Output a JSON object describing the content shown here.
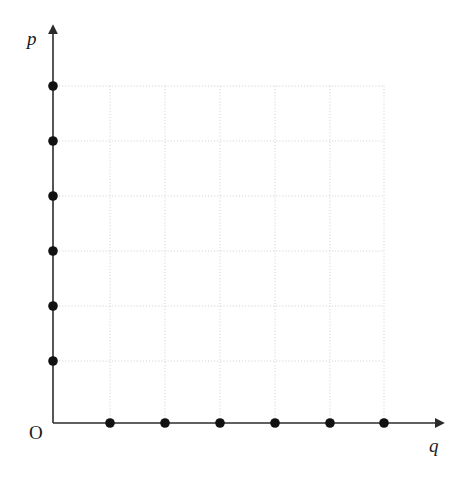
{
  "figure": {
    "kind": "coordinate-grid-scatter",
    "background_color": "#ffffff",
    "width": 463,
    "height": 482
  },
  "labels": {
    "y_axis": "p",
    "x_axis": "q",
    "origin": "O"
  },
  "axes": {
    "origin_px": {
      "x": 53,
      "y": 423
    },
    "x_axis_end_px": {
      "x": 437,
      "y": 423
    },
    "y_axis_end_px": {
      "x": 53,
      "y": 32
    },
    "axis_color": "#2b2b2b",
    "axis_width_px": 1.6,
    "arrow_heads": [
      "x-axis-right",
      "y-axis-up"
    ]
  },
  "grid": {
    "style": "dotted",
    "color": "#c9c9c9",
    "line_width_px": 0.9,
    "x_positions_px": [
      110,
      165,
      220,
      275,
      330,
      384
    ],
    "y_positions_px": [
      86,
      141,
      196,
      251,
      306,
      361
    ],
    "left_px": 53,
    "right_px": 384,
    "top_px": 86,
    "bottom_px": 423
  },
  "chart_data": {
    "type": "scatter",
    "title": "",
    "subtitle": "",
    "xlabel": "q",
    "ylabel": "p",
    "grid": true,
    "legend": "none",
    "xlim": [
      0,
      7
    ],
    "ylim": [
      0,
      7
    ],
    "x_tick_values": [
      1,
      2,
      3,
      4,
      5,
      6
    ],
    "y_tick_values": [
      1,
      2,
      3,
      4,
      5,
      6
    ],
    "x_tick_labels": [
      "",
      "",
      "",
      "",
      "",
      ""
    ],
    "y_tick_labels": [
      "",
      "",
      "",
      "",
      "",
      ""
    ],
    "marker": "filled-circle",
    "marker_color": "#111111",
    "marker_radius_px": 4.8,
    "series": [
      {
        "name": "points-on-q-axis",
        "points": [
          {
            "x": 1,
            "y": 0,
            "px": 110,
            "py": 423
          },
          {
            "x": 2,
            "y": 0,
            "px": 165,
            "py": 423
          },
          {
            "x": 3,
            "y": 0,
            "px": 220,
            "py": 423
          },
          {
            "x": 4,
            "y": 0,
            "px": 275,
            "py": 423
          },
          {
            "x": 5,
            "y": 0,
            "px": 330,
            "py": 423
          },
          {
            "x": 6,
            "y": 0,
            "px": 384,
            "py": 423
          }
        ]
      },
      {
        "name": "points-on-p-axis",
        "points": [
          {
            "x": 0,
            "y": 1,
            "px": 53,
            "py": 361
          },
          {
            "x": 0,
            "y": 2,
            "px": 53,
            "py": 306
          },
          {
            "x": 0,
            "y": 3,
            "px": 53,
            "py": 251
          },
          {
            "x": 0,
            "y": 4,
            "px": 53,
            "py": 196
          },
          {
            "x": 0,
            "y": 5,
            "px": 53,
            "py": 141
          },
          {
            "x": 0,
            "y": 6,
            "px": 53,
            "py": 86
          }
        ]
      }
    ],
    "annotations": []
  },
  "colors": {
    "axis": "#2b2b2b",
    "grid": "#c9c9c9",
    "marker": "#111111",
    "text": "#1a1a1a",
    "background": "#ffffff"
  }
}
